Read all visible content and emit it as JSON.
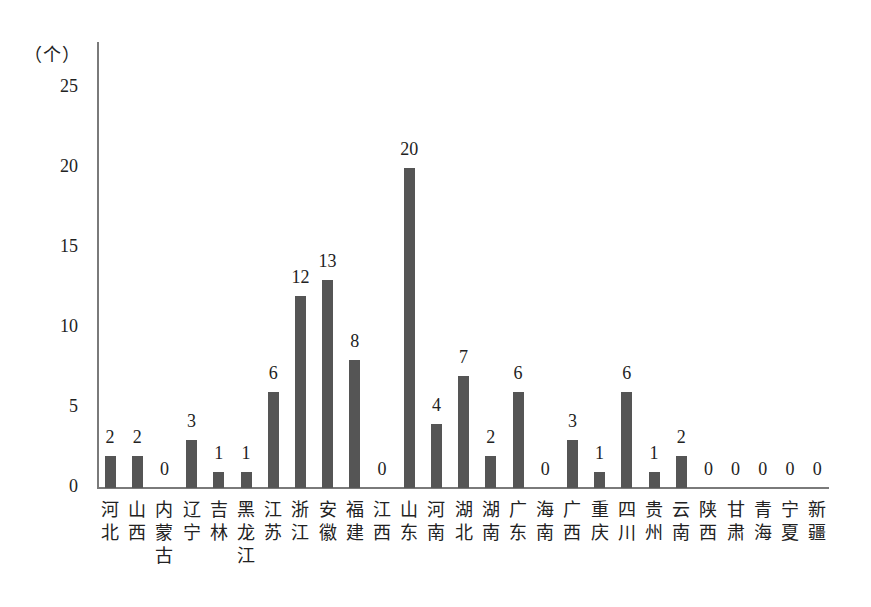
{
  "chart_data": {
    "type": "bar",
    "title": "",
    "xlabel": "",
    "ylabel": "（个）",
    "ylim": [
      0,
      25
    ],
    "yticks": [
      0,
      5,
      10,
      15,
      20,
      25
    ],
    "grid": false,
    "legend": null,
    "bar_color": "#555555",
    "categories": [
      "河北",
      "山西",
      "内蒙古",
      "辽宁",
      "吉林",
      "黑龙江",
      "江苏",
      "浙江",
      "安徽",
      "福建",
      "江西",
      "山东",
      "河南",
      "湖北",
      "湖南",
      "广东",
      "海南",
      "广西",
      "重庆",
      "四川",
      "贵州",
      "云南",
      "陕西",
      "甘肃",
      "青海",
      "宁夏",
      "新疆"
    ],
    "values": [
      2,
      2,
      0,
      3,
      1,
      1,
      6,
      12,
      13,
      8,
      0,
      20,
      4,
      7,
      2,
      6,
      0,
      3,
      1,
      6,
      1,
      2,
      0,
      0,
      0,
      0,
      0
    ],
    "data_labels": true
  },
  "axis": {
    "unit_label": "（个）",
    "yticks": [
      "25",
      "20",
      "15",
      "10",
      "5",
      "0"
    ]
  }
}
